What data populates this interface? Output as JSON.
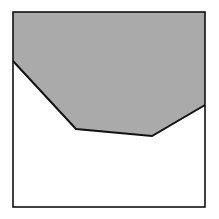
{
  "diagram": {
    "type": "shaded-region-in-square",
    "frame": {
      "x1": 13,
      "y1": 12,
      "x2": 205,
      "y2": 207,
      "stroke": "#111111",
      "stroke_width": 1.6
    },
    "boundary_polyline": [
      [
        13,
        61
      ],
      [
        76,
        129
      ],
      [
        152,
        136
      ],
      [
        205,
        105
      ]
    ],
    "shaded_region": {
      "fill": "#aaaaaa",
      "polygon": [
        [
          13,
          12
        ],
        [
          205,
          12
        ],
        [
          205,
          105
        ],
        [
          152,
          136
        ],
        [
          76,
          129
        ],
        [
          13,
          61
        ]
      ]
    },
    "unshaded_fill": "#ffffff",
    "boundary_stroke": "#111111",
    "boundary_stroke_width": 2
  }
}
